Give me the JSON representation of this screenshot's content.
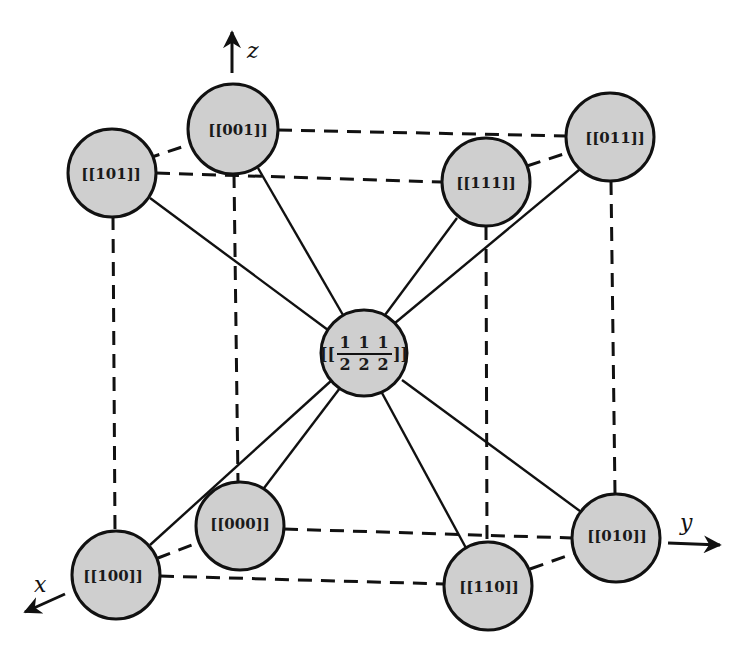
{
  "diagram": {
    "title": "",
    "colors": {
      "node_fill": "#cfcfcf",
      "stroke": "#111111",
      "background": "#ffffff"
    },
    "axes": [
      {
        "id": "z",
        "label": "z"
      },
      {
        "id": "y",
        "label": "y"
      },
      {
        "id": "x",
        "label": "x"
      }
    ],
    "nodes": [
      {
        "id": "n001",
        "label": "[[001]]"
      },
      {
        "id": "n101",
        "label": "[[101]]"
      },
      {
        "id": "n111",
        "label": "[[111]]"
      },
      {
        "id": "n011",
        "label": "[[011]]"
      },
      {
        "id": "n000",
        "label": "[[000]]"
      },
      {
        "id": "n100",
        "label": "[[100]]"
      },
      {
        "id": "n110",
        "label": "[[110]]"
      },
      {
        "id": "n010",
        "label": "[[010]]"
      },
      {
        "id": "center",
        "label_prefix": "[[",
        "label_suffix": "]]",
        "numerators": [
          "1",
          "1",
          "1"
        ],
        "denominators": [
          "2",
          "2",
          "2"
        ]
      }
    ],
    "edges_dashed": [
      [
        "n001",
        "n011"
      ],
      [
        "n001",
        "n101"
      ],
      [
        "n101",
        "n111"
      ],
      [
        "n111",
        "n011"
      ],
      [
        "n000",
        "n010"
      ],
      [
        "n000",
        "n100"
      ],
      [
        "n100",
        "n110"
      ],
      [
        "n110",
        "n010"
      ],
      [
        "n101",
        "n100"
      ],
      [
        "n001",
        "n000"
      ],
      [
        "n111",
        "n110"
      ],
      [
        "n011",
        "n010"
      ]
    ],
    "edges_solid": [
      [
        "center",
        "n001"
      ],
      [
        "center",
        "n101"
      ],
      [
        "center",
        "n111"
      ],
      [
        "center",
        "n011"
      ],
      [
        "center",
        "n000"
      ],
      [
        "center",
        "n100"
      ],
      [
        "center",
        "n110"
      ],
      [
        "center",
        "n010"
      ]
    ]
  }
}
